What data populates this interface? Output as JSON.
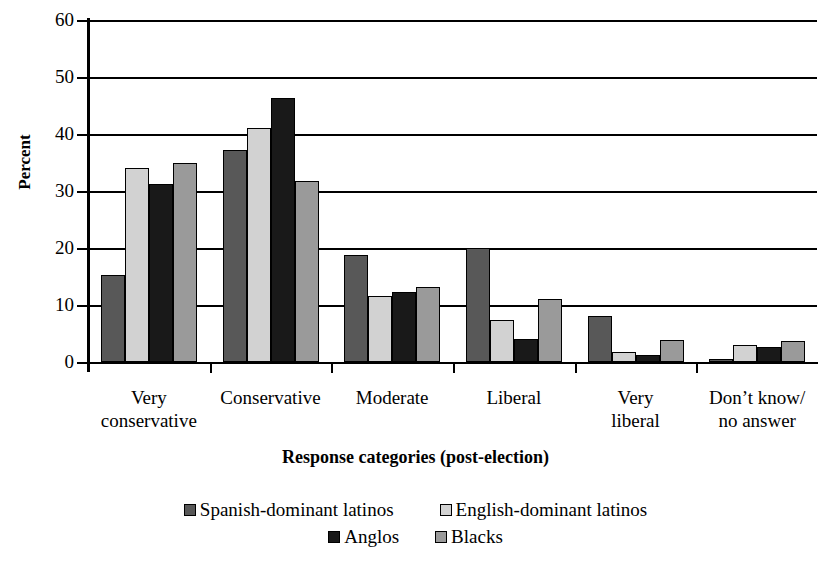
{
  "chart_data": {
    "type": "bar",
    "title": "",
    "xlabel": "Response categories (post-election)",
    "ylabel": "Percent",
    "ylim": [
      0,
      60
    ],
    "yticks": [
      0,
      10,
      20,
      30,
      40,
      50,
      60
    ],
    "grid": true,
    "legend_position": "bottom",
    "categories": [
      "Very conservative",
      "Conservative",
      "Moderate",
      "Liberal",
      "Very liberal",
      "Don’t know/ no answer"
    ],
    "category_lines": [
      [
        "Very",
        "conservative"
      ],
      [
        "Conservative",
        ""
      ],
      [
        "Moderate",
        ""
      ],
      [
        "Liberal",
        ""
      ],
      [
        "Very",
        "liberal"
      ],
      [
        "Don’t know/",
        "no answer"
      ]
    ],
    "series": [
      {
        "name": "Spanish-dominant latinos",
        "color": "#585858",
        "values": [
          15.2,
          37.2,
          18.8,
          20.0,
          8.0,
          0.5
        ]
      },
      {
        "name": "English-dominant latinos",
        "color": "#d2d2d2",
        "values": [
          34.0,
          41.0,
          11.5,
          7.4,
          1.8,
          3.0
        ]
      },
      {
        "name": "Anglos",
        "color": "#191919",
        "values": [
          31.3,
          46.3,
          12.2,
          4.1,
          1.3,
          2.7
        ]
      },
      {
        "name": "Blacks",
        "color": "#9a9a9a",
        "values": [
          35.0,
          31.7,
          13.1,
          11.0,
          3.9,
          3.6
        ]
      }
    ]
  },
  "axis": {
    "ytick_labels": [
      "0",
      "10",
      "20",
      "30",
      "40",
      "50",
      "60"
    ]
  }
}
